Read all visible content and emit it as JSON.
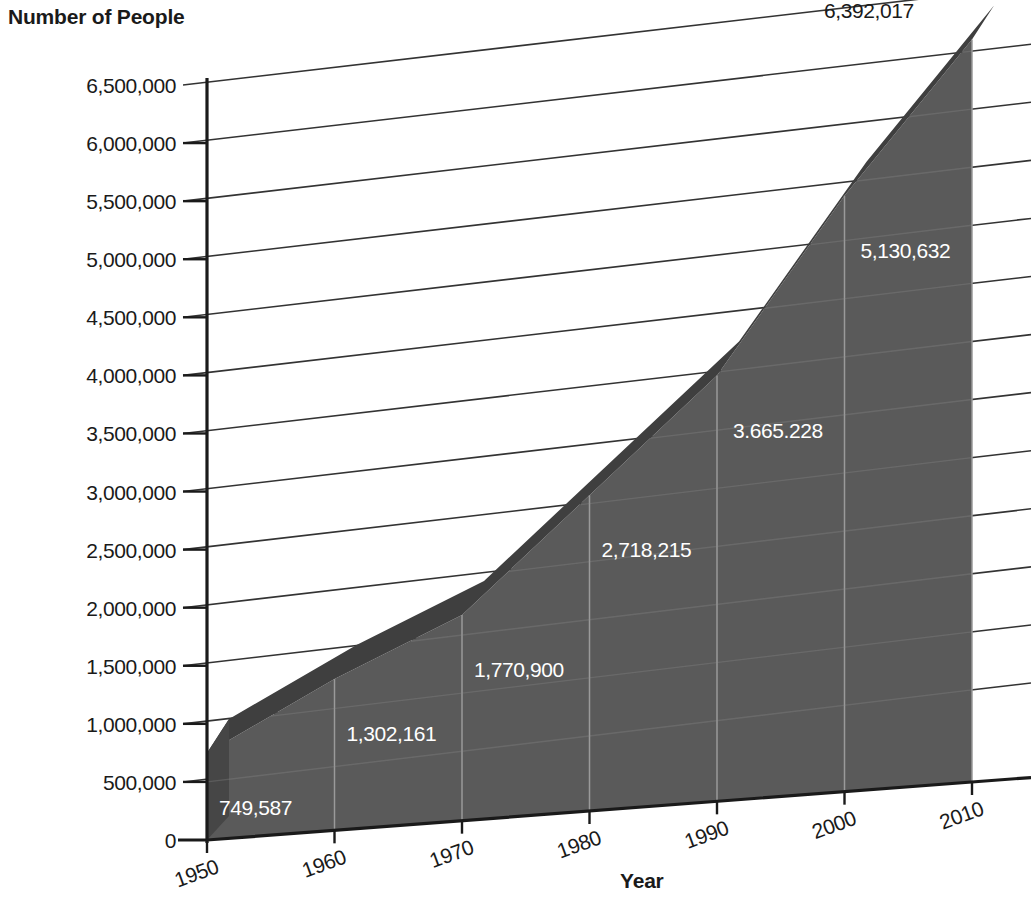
{
  "chart_data": {
    "type": "area",
    "title": "",
    "ylabel": "Number of People",
    "xlabel": "Year",
    "categories": [
      "1950",
      "1960",
      "1970",
      "1980",
      "1990",
      "2000",
      "2010"
    ],
    "x": [
      1950,
      1960,
      1970,
      1980,
      1990,
      2000,
      2010
    ],
    "values": [
      749587,
      1302161,
      1770900,
      2718215,
      3665228,
      5130632,
      6392017
    ],
    "point_labels": [
      "749,587",
      "1,302,161",
      "1,770,900",
      "2,718,215",
      "3.665.228",
      "5,130,632",
      "6,392,017"
    ],
    "ylim": [
      0,
      6500000
    ],
    "ytick_values": [
      0,
      500000,
      1000000,
      1500000,
      2000000,
      2500000,
      3000000,
      3500000,
      4000000,
      4500000,
      5000000,
      5500000,
      6000000,
      6500000
    ],
    "ytick_labels": [
      "0",
      "500,000",
      "1,000,000",
      "1,500,000",
      "2,000,000",
      "2,500,000",
      "3,000,000",
      "3,500,000",
      "4,000,000",
      "4,500,000",
      "5,000,000",
      "5,500,000",
      "6,000,000",
      "6,500,000"
    ],
    "grid": true,
    "legend": "none",
    "style": "3d-area",
    "colors": {
      "area_front": "#5a5a5a",
      "area_top": "#3f3f3f",
      "area_cap": "#464646",
      "gridline": "#333333",
      "inner_gridline": "#9a9a9a",
      "axis": "#1a1a1a",
      "label_inside": "#ffffff",
      "label_outside": "#1a1a1a",
      "background": "#ffffff"
    }
  },
  "axes": {
    "y_axis_title": "Number of People",
    "x_axis_title": "Year"
  }
}
